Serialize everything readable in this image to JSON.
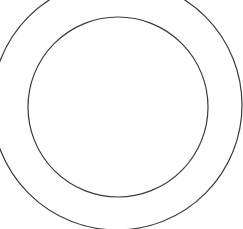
{
  "diagram": {
    "type": "concentric-circles",
    "background": "#ffffff",
    "stroke_color": "#3a3a3a",
    "outer_circle": {
      "cx": 117,
      "cy": 105,
      "r": 125,
      "stroke_width": 1.2
    },
    "inner_circle": {
      "cx": 118,
      "cy": 107,
      "r": 90,
      "stroke_width": 1.2
    }
  }
}
